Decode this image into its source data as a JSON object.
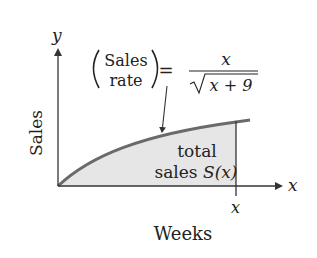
{
  "diagram": {
    "type": "area-under-curve",
    "axes": {
      "y_axis_symbol": "y",
      "x_axis_symbol": "x",
      "y_label": "Sales",
      "x_label": "Weeks",
      "x_tick_label": "x"
    },
    "formula": {
      "lhs_top": "Sales",
      "lhs_bottom": "rate",
      "equals": "=",
      "numerator": "x",
      "denominator_radicand": "x + 9"
    },
    "region": {
      "label_line1": "total",
      "label_line2_prefix": "sales ",
      "label_line2_func": "S",
      "label_line2_arg": "(x)"
    },
    "colors": {
      "curve": "#666666",
      "fill": "#e6e6e6",
      "axis": "#333333",
      "text": "#222222"
    }
  }
}
